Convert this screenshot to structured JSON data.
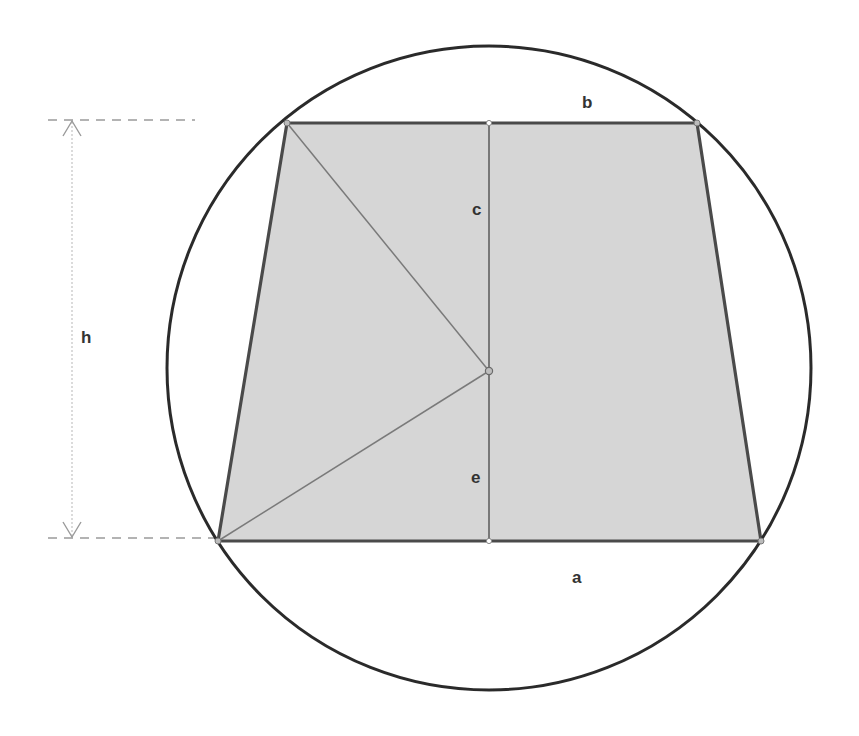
{
  "diagram": {
    "type": "geometry",
    "colors": {
      "background": "#ffffff",
      "circle_stroke": "#2b2b2b",
      "trapezoid_fill": "#d6d6d6",
      "trapezoid_stroke": "#4a4a4a",
      "inner_lines": "#6e6e6e",
      "dimension_lines": "#9a9a9a",
      "label_color": "#333333"
    },
    "circle": {
      "cx": 489,
      "cy": 368,
      "r": 322
    },
    "trapezoid": {
      "top_left": [
        287,
        123
      ],
      "top_right": [
        697,
        123
      ],
      "bottom_right": [
        761,
        541
      ],
      "bottom_left": [
        218,
        541
      ]
    },
    "center_point": [
      489,
      371
    ],
    "labels": {
      "a": "a",
      "b": "b",
      "c": "c",
      "e": "e",
      "h": "h"
    }
  }
}
